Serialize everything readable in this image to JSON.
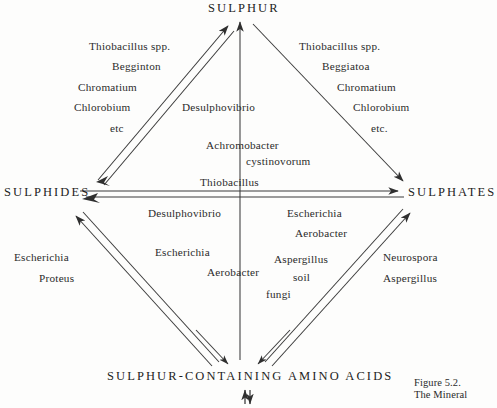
{
  "figure": {
    "nodes": {
      "top": "SULPHUR",
      "left": "SULPHIDES",
      "right": "SULPHATES",
      "bottom": "SULPHUR-CONTAINING AMINO ACIDS"
    },
    "groups": {
      "upper_left": [
        "Thiobacillus spp.",
        "Begginton",
        "Chromatium",
        "Chlorobium",
        "etc"
      ],
      "upper_right": [
        "Thiobacillus spp.",
        "Beggiatoa",
        "Chromatium",
        "Chlorobium",
        "etc."
      ],
      "upper_center": [
        "Desulphovibrio",
        "Achromobacter",
        "cystinovorum"
      ],
      "middle": [
        "Thiobacillus"
      ],
      "lower_left_inner": [
        "Desulphovibrio",
        "Escherichia",
        "Aerobacter"
      ],
      "lower_right_inner": [
        "Escherichia",
        "Aerobacter",
        "Aspergillus",
        "soil",
        "fungi"
      ],
      "lower_left_outer": [
        "Escherichia",
        "Proteus"
      ],
      "lower_right_outer": [
        "Neurospora",
        "Aspergillus"
      ]
    },
    "caption": {
      "line1": "Figure 5.2.",
      "line2": "The Mineral"
    },
    "colors": {
      "ink": "#2b2b2b",
      "line": "#3a3a3a",
      "background": "#fdfdfc"
    }
  }
}
